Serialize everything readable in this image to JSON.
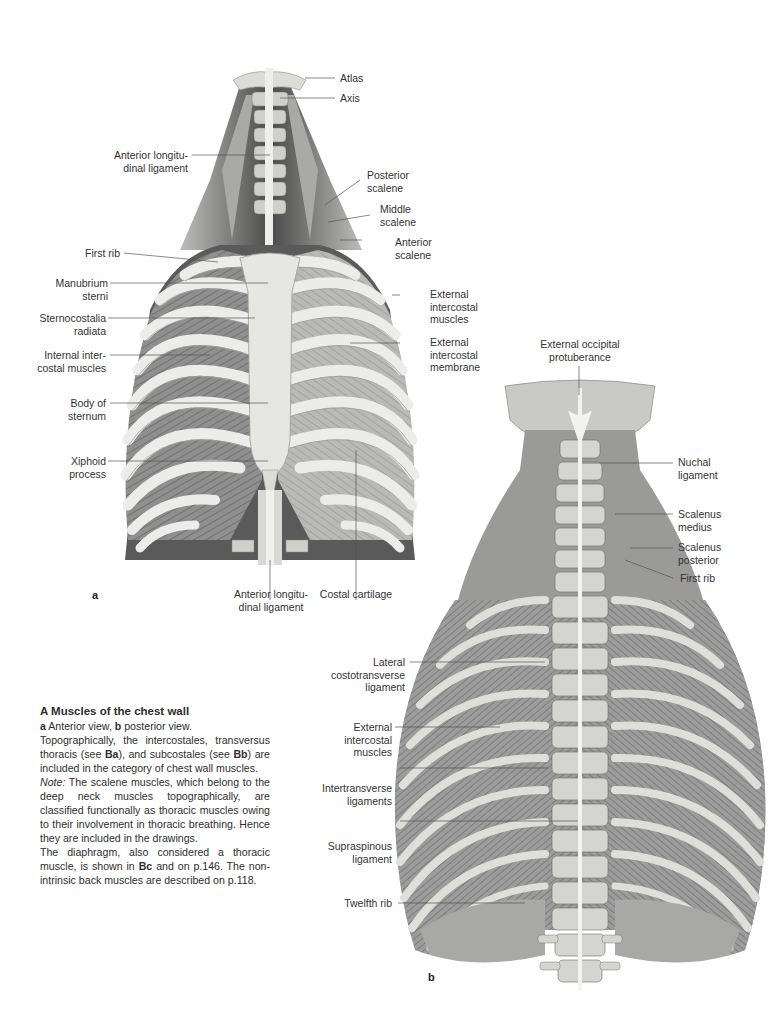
{
  "figure_a": {
    "letter": "a",
    "view": "anterior",
    "labels": {
      "atlas": [
        "Atlas"
      ],
      "axis": [
        "Axis"
      ],
      "ant_long_lig_top": [
        "Anterior longitu-",
        "dinal ligament"
      ],
      "posterior_scalene": [
        "Posterior",
        "scalene"
      ],
      "middle_scalene": [
        "Middle",
        "scalene"
      ],
      "anterior_scalene": [
        "Anterior",
        "scalene"
      ],
      "first_rib": [
        "First rib"
      ],
      "manubrium": [
        "Manubrium",
        "sterni"
      ],
      "sternocostalia": [
        "Sternocostalia",
        "radiata"
      ],
      "internal_intercostal": [
        "Internal inter-",
        "costal muscles"
      ],
      "body_sternum": [
        "Body of",
        "sternum"
      ],
      "xiphoid": [
        "Xiphoid",
        "process"
      ],
      "external_intercostal_muscles": [
        "External",
        "intercostal",
        "muscles"
      ],
      "external_intercostal_membrane": [
        "External",
        "intercostal",
        "membrane"
      ],
      "ant_long_lig_bottom": [
        "Anterior longitu-",
        "dinal ligament"
      ],
      "costal_cartilage": [
        "Costal cartilage"
      ]
    }
  },
  "figure_b": {
    "letter": "b",
    "view": "posterior",
    "labels": {
      "ext_occipital": [
        "External occipital",
        "protuberance"
      ],
      "nuchal": [
        "Nuchal",
        "ligament"
      ],
      "scalenus_medius": [
        "Scalenus",
        "medius"
      ],
      "scalenus_posterior": [
        "Scalenus",
        "posterior"
      ],
      "first_rib": [
        "First rib"
      ],
      "lateral_costotransverse": [
        "Lateral",
        "costotransverse",
        "ligament"
      ],
      "external_intercostal": [
        "External",
        "intercostal",
        "muscles"
      ],
      "intertransverse": [
        "Intertransverse",
        "ligaments"
      ],
      "supraspinous": [
        "Supraspinous",
        "ligament"
      ],
      "twelfth_rib": [
        "Twelfth rib"
      ]
    }
  },
  "caption": {
    "title": "A  Muscles of the chest wall",
    "line1_a": "a",
    "line1_a_text": "  Anterior view, ",
    "line1_b": "b",
    "line1_b_text": "  posterior view.",
    "p1_start": "Topographically, the intercostales, transversus thoracis (see ",
    "p1_ref1": "Ba",
    "p1_mid": "), and subcostales (see ",
    "p1_ref2": "Bb",
    "p1_end": ") are included in the category of chest wall muscles.",
    "p2_note": "Note:",
    "p2_text": " The scalene muscles, which belong to the deep neck muscles topographically, are classified functionally as thoracic muscles owing to their involvement in thoracic breathing. Hence they are included in the drawings.",
    "p3_start": "The diaphragm, also considered a thoracic muscle, is shown in ",
    "p3_ref": "Bc",
    "p3_end": " and on p.146. The non-intrinsic back muscles are described on p.118."
  },
  "colors": {
    "bone": "#e9e9e6",
    "muscle": "#8d8d8d",
    "muscle_dark": "#5c5c5c",
    "cavity": "#3a3a3a",
    "leader_line": "#555555",
    "text": "#2e2e2e"
  }
}
